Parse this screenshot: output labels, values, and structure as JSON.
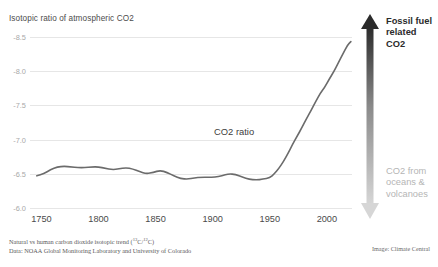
{
  "chart_data": {
    "type": "line",
    "title": "Isotopic ratio of atmospheric CO2",
    "xlabel": "",
    "ylabel": "",
    "grid": true,
    "legend": "inline-label",
    "xlim": [
      1740,
      2022
    ],
    "ylim": [
      -6.0,
      -8.6
    ],
    "y_inverted": true,
    "xticks": [
      1750,
      1800,
      1850,
      1900,
      1950,
      2000
    ],
    "yticks": [
      -8.5,
      -8.0,
      -7.5,
      -7.0,
      -6.5,
      -6.0
    ],
    "xtick_labels": [
      "1750",
      "1800",
      "1850",
      "1900",
      "1950",
      "2000"
    ],
    "ytick_labels": [
      "-8.5",
      "-8.0",
      "-7.5",
      "-7.0",
      "-6.5",
      "-6.0"
    ],
    "series": [
      {
        "name": "CO2 ratio",
        "color": "#6b6b6b",
        "x": [
          1746,
          1752,
          1758,
          1764,
          1770,
          1776,
          1782,
          1788,
          1794,
          1800,
          1806,
          1812,
          1818,
          1824,
          1830,
          1836,
          1842,
          1848,
          1854,
          1860,
          1866,
          1872,
          1878,
          1884,
          1890,
          1896,
          1902,
          1908,
          1914,
          1920,
          1926,
          1932,
          1938,
          1944,
          1950,
          1954,
          1958,
          1962,
          1966,
          1970,
          1974,
          1978,
          1982,
          1986,
          1990,
          1994,
          1998,
          2002,
          2006,
          2010,
          2014,
          2018,
          2021
        ],
        "y": [
          -6.47,
          -6.5,
          -6.56,
          -6.6,
          -6.61,
          -6.6,
          -6.59,
          -6.59,
          -6.6,
          -6.6,
          -6.58,
          -6.56,
          -6.57,
          -6.59,
          -6.57,
          -6.53,
          -6.5,
          -6.52,
          -6.55,
          -6.52,
          -6.47,
          -6.43,
          -6.42,
          -6.44,
          -6.45,
          -6.45,
          -6.45,
          -6.47,
          -6.5,
          -6.49,
          -6.45,
          -6.42,
          -6.41,
          -6.42,
          -6.44,
          -6.5,
          -6.58,
          -6.68,
          -6.8,
          -6.93,
          -7.05,
          -7.17,
          -7.3,
          -7.42,
          -7.55,
          -7.67,
          -7.76,
          -7.88,
          -7.99,
          -8.12,
          -8.25,
          -8.38,
          -8.43
        ]
      }
    ],
    "annotations": [
      {
        "text": "CO2 ratio",
        "kind": "series-label"
      },
      {
        "text": "Fossil fuel related CO2",
        "kind": "arrow-top",
        "color": "#2b2b2b"
      },
      {
        "text": "CO2 from oceans & volcanoes",
        "kind": "arrow-bottom",
        "color": "#b5b5b5"
      }
    ]
  },
  "chart": {
    "title": "Isotopic ratio of atmospheric CO2",
    "series_label": "CO2 ratio",
    "y_labels": [
      "-8.5",
      "-8.0",
      "-7.5",
      "-7.0",
      "-6.5",
      "-6.0"
    ],
    "x_labels": [
      "1750",
      "1800",
      "1850",
      "1900",
      "1950",
      "2000"
    ]
  },
  "annotations": {
    "top_line1": "Fossil fuel",
    "top_line2": "related",
    "top_line3": "CO2",
    "bottom_line1": "CO2 from",
    "bottom_line2": "oceans &",
    "bottom_line3": "volcanoes"
  },
  "footer": {
    "line1_pre": "Natural vs human carbon dioxide isotopic trend (",
    "line1_sup1": "13",
    "line1_mid": "C/",
    "line1_sup2": "12",
    "line1_post": "C)",
    "line2": "Data: NOAA Global Monitoring Laboratory and University of Colorado",
    "credit": "Image: Climate Central"
  },
  "colors": {
    "line": "#6b6b6b",
    "grid": "#e6e6e6",
    "arrow_top": "#2b2b2b",
    "arrow_bottom": "#cfcfcf",
    "y_tick": "#a8a8a8",
    "x_tick": "#4a4a4a"
  }
}
